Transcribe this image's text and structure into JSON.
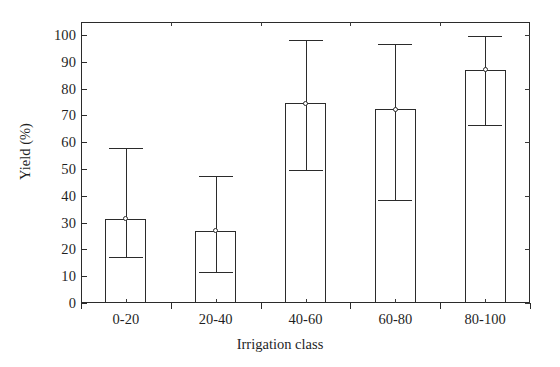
{
  "chart_data": {
    "type": "bar",
    "title": "",
    "xlabel": "Irrigation class",
    "ylabel": "Yield (%)",
    "categories": [
      "0-20",
      "20-40",
      "40-60",
      "60-80",
      "80-100"
    ],
    "values": [
      31.5,
      27.0,
      74.5,
      72.3,
      87.0
    ],
    "error_low": [
      17.0,
      11.7,
      49.5,
      38.3,
      66.5
    ],
    "error_high": [
      58.0,
      47.5,
      98.0,
      96.8,
      99.5
    ],
    "series": [
      {
        "name": "Yield",
        "values": [
          31.5,
          27.0,
          74.5,
          72.3,
          87.0
        ]
      }
    ],
    "ylim": [
      0,
      100
    ],
    "yticks": [
      0,
      10,
      20,
      30,
      40,
      50,
      60,
      70,
      80,
      90,
      100
    ],
    "ytick_labels": [
      "0",
      "10",
      "20",
      "30",
      "40",
      "50",
      "60",
      "70",
      "80",
      "90",
      "100"
    ],
    "grid": false,
    "legend": false,
    "legend_position": "none",
    "bar_facecolor": "#ffffff",
    "bar_edgecolor": "#2b2b2b",
    "error_color": "#2b2b2b",
    "background": "#ffffff"
  },
  "axes": {
    "y_label": "Yield (%)",
    "x_label": "Irrigation class"
  }
}
